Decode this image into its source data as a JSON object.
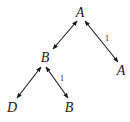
{
  "diagram": {
    "type": "tree",
    "nodes": [
      {
        "id": "root",
        "label": "A",
        "x": 80,
        "y": 17
      },
      {
        "id": "left",
        "label": "B",
        "x": 45,
        "y": 62
      },
      {
        "id": "right",
        "label": "A",
        "x": 121,
        "y": 75
      },
      {
        "id": "leftleft",
        "label": "D",
        "x": 12,
        "y": 112
      },
      {
        "id": "leftright",
        "label": "B",
        "x": 69,
        "y": 112
      }
    ],
    "edges": [
      {
        "from": "root",
        "to": "left",
        "label": ""
      },
      {
        "from": "root",
        "to": "right",
        "label": "1"
      },
      {
        "from": "left",
        "to": "leftleft",
        "label": ""
      },
      {
        "from": "left",
        "to": "leftright",
        "label": "1"
      }
    ]
  }
}
